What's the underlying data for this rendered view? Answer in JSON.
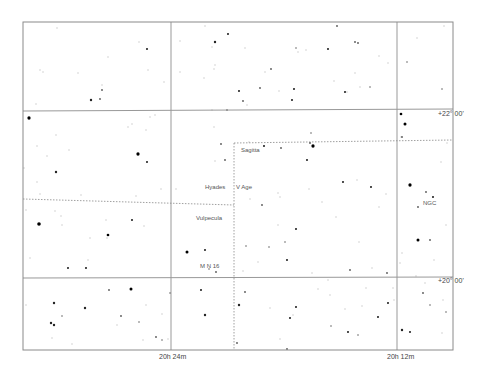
{
  "map": {
    "type": "star-chart",
    "frame": {
      "x": 23,
      "y": 22,
      "width": 430,
      "height": 328
    },
    "grid": {
      "color": "#999999",
      "ra_lines": [
        {
          "x": 171,
          "label": "20h 24m"
        },
        {
          "x": 397,
          "label": "20h 12m"
        }
      ],
      "dec_lines": [
        {
          "y1": 111,
          "y2": 109,
          "label": "+22° 00'"
        },
        {
          "y1": 278,
          "y2": 277,
          "label": "+20° 00'"
        }
      ]
    },
    "axis_labels": {
      "ra_left": "20h 24m",
      "ra_right": "20h 12m",
      "dec_top": "+22° 00'",
      "dec_bottom": "+20° 00'"
    },
    "constellation_boundaries": {
      "color": "#888888",
      "segments": [
        {
          "x1": 23,
          "y1": 199,
          "x2": 234,
          "y2": 205
        },
        {
          "x1": 234,
          "y1": 143,
          "x2": 453,
          "y2": 140
        },
        {
          "x1": 234,
          "y1": 143,
          "x2": 234,
          "y2": 350
        }
      ]
    },
    "object_labels": [
      {
        "text": "Sagitta",
        "x": 241,
        "y": 150
      },
      {
        "text": "Hyades",
        "x": 205,
        "y": 187
      },
      {
        "text": "V Age",
        "x": 236,
        "y": 187
      },
      {
        "text": "Vulpecula",
        "x": 197,
        "y": 218
      },
      {
        "text": "M N 16",
        "x": 200,
        "y": 266
      },
      {
        "text": "NGC",
        "x": 423,
        "y": 203
      }
    ],
    "stars": [
      [
        29,
        118,
        2.2
      ],
      [
        39,
        224,
        2.4
      ],
      [
        56,
        172,
        1.6
      ],
      [
        85,
        308,
        1.6
      ],
      [
        91,
        100,
        1.6
      ],
      [
        100,
        99,
        1.2
      ],
      [
        102,
        90,
        1.2
      ],
      [
        108,
        235,
        1.8
      ],
      [
        86,
        268,
        1.4
      ],
      [
        68,
        268,
        1.4
      ],
      [
        54,
        303,
        1.6
      ],
      [
        51,
        323,
        1.6
      ],
      [
        54,
        325,
        1.6
      ],
      [
        62,
        316,
        1.0
      ],
      [
        147,
        49,
        1.4
      ],
      [
        138,
        154,
        2.2
      ],
      [
        147,
        162,
        1.4
      ],
      [
        131,
        289,
        2.0
      ],
      [
        132,
        220,
        1.4
      ],
      [
        109,
        290,
        1.2
      ],
      [
        121,
        316,
        1.2
      ],
      [
        139,
        322,
        1.0
      ],
      [
        156,
        337,
        1.2
      ],
      [
        162,
        340,
        1.0
      ],
      [
        215,
        42,
        1.6
      ],
      [
        228,
        34,
        1.4
      ],
      [
        227,
        110,
        1.0
      ],
      [
        239,
        91,
        1.4
      ],
      [
        243,
        101,
        1.2
      ],
      [
        260,
        88,
        1.2
      ],
      [
        294,
        89,
        1.4
      ],
      [
        311,
        133,
        1.0
      ],
      [
        292,
        100,
        1.4
      ],
      [
        296,
        48,
        1.0
      ],
      [
        271,
        69,
        1.2
      ],
      [
        328,
        49,
        1.4
      ],
      [
        337,
        26,
        1.2
      ],
      [
        355,
        42,
        1.2
      ],
      [
        358,
        43,
        1.2
      ],
      [
        345,
        92,
        1.4
      ],
      [
        370,
        87,
        1.0
      ],
      [
        401,
        114,
        1.8
      ],
      [
        405,
        124,
        2.0
      ],
      [
        402,
        137,
        1.2
      ],
      [
        187,
        252,
        2.0
      ],
      [
        205,
        250,
        1.4
      ],
      [
        216,
        272,
        1.2
      ],
      [
        201,
        290,
        1.4
      ],
      [
        205,
        315,
        1.6
      ],
      [
        170,
        293,
        1.0
      ],
      [
        209,
        269,
        1.0
      ],
      [
        221,
        144,
        1.2
      ],
      [
        225,
        160,
        1.2
      ],
      [
        264,
        146,
        1.4
      ],
      [
        281,
        148,
        1.2
      ],
      [
        313,
        146,
        2.2
      ],
      [
        310,
        143,
        1.2
      ],
      [
        307,
        160,
        1.4
      ],
      [
        343,
        182,
        1.4
      ],
      [
        371,
        187,
        1.4
      ],
      [
        262,
        205,
        1.2
      ],
      [
        269,
        247,
        1.0
      ],
      [
        296,
        229,
        1.4
      ],
      [
        287,
        260,
        1.4
      ],
      [
        285,
        242,
        1.0
      ],
      [
        246,
        246,
        1.0
      ],
      [
        239,
        305,
        1.6
      ],
      [
        245,
        292,
        1.2
      ],
      [
        237,
        343,
        1.2
      ],
      [
        287,
        349,
        1.2
      ],
      [
        290,
        318,
        1.4
      ],
      [
        296,
        307,
        1.4
      ],
      [
        331,
        326,
        1.0
      ],
      [
        348,
        332,
        1.4
      ],
      [
        358,
        335,
        1.0
      ],
      [
        378,
        317,
        1.4
      ],
      [
        388,
        303,
        1.4
      ],
      [
        410,
        185,
        2.2
      ],
      [
        426,
        192,
        1.2
      ],
      [
        418,
        207,
        1.2
      ],
      [
        433,
        197,
        1.4
      ],
      [
        418,
        240,
        2.0
      ],
      [
        423,
        293,
        1.2
      ],
      [
        430,
        305,
        1.0
      ],
      [
        402,
        330,
        1.6
      ],
      [
        410,
        332,
        1.4
      ],
      [
        446,
        312,
        1.0
      ],
      [
        350,
        270,
        1.2
      ],
      [
        387,
        273,
        1.2
      ],
      [
        407,
        62,
        1.0
      ],
      [
        442,
        89,
        1.0
      ],
      [
        430,
        240,
        1.2
      ]
    ],
    "faint_stars": [
      [
        57,
        28
      ],
      [
        78,
        73
      ],
      [
        40,
        70
      ],
      [
        43,
        72
      ],
      [
        108,
        57
      ],
      [
        102,
        85
      ],
      [
        36,
        104
      ],
      [
        56,
        135
      ],
      [
        37,
        146
      ],
      [
        47,
        156
      ],
      [
        37,
        182
      ],
      [
        69,
        150
      ],
      [
        128,
        127
      ],
      [
        150,
        117
      ],
      [
        146,
        130
      ],
      [
        155,
        115
      ],
      [
        24,
        168
      ],
      [
        40,
        194
      ],
      [
        26,
        210
      ],
      [
        81,
        195
      ],
      [
        55,
        211
      ],
      [
        61,
        216
      ],
      [
        90,
        238
      ],
      [
        106,
        220
      ],
      [
        144,
        226
      ],
      [
        176,
        189
      ],
      [
        161,
        189
      ],
      [
        136,
        196
      ],
      [
        132,
        124
      ],
      [
        164,
        82
      ],
      [
        148,
        70
      ],
      [
        139,
        42
      ],
      [
        30,
        258
      ],
      [
        107,
        238
      ],
      [
        62,
        225
      ],
      [
        26,
        305
      ],
      [
        52,
        338
      ],
      [
        72,
        344
      ],
      [
        88,
        260
      ],
      [
        117,
        325
      ],
      [
        162,
        314
      ],
      [
        143,
        340
      ],
      [
        168,
        339
      ],
      [
        146,
        305
      ],
      [
        205,
        26
      ],
      [
        180,
        41
      ],
      [
        212,
        47
      ],
      [
        180,
        72
      ],
      [
        204,
        78
      ],
      [
        212,
        110
      ],
      [
        214,
        127
      ],
      [
        215,
        65
      ],
      [
        245,
        48
      ],
      [
        279,
        91
      ],
      [
        265,
        72
      ],
      [
        214,
        69
      ],
      [
        247,
        105
      ],
      [
        306,
        50
      ],
      [
        298,
        52
      ],
      [
        334,
        81
      ],
      [
        347,
        92
      ],
      [
        360,
        87
      ],
      [
        379,
        56
      ],
      [
        388,
        63
      ],
      [
        355,
        73
      ],
      [
        401,
        137
      ],
      [
        417,
        38
      ],
      [
        444,
        26
      ],
      [
        249,
        142
      ],
      [
        215,
        161
      ],
      [
        250,
        199
      ],
      [
        243,
        271
      ],
      [
        280,
        197
      ],
      [
        278,
        225
      ],
      [
        258,
        262
      ],
      [
        278,
        193
      ],
      [
        309,
        189
      ],
      [
        322,
        202
      ],
      [
        336,
        217
      ],
      [
        357,
        180
      ],
      [
        379,
        207
      ],
      [
        386,
        194
      ],
      [
        402,
        253
      ],
      [
        400,
        263
      ],
      [
        359,
        242
      ],
      [
        312,
        273
      ],
      [
        293,
        315
      ],
      [
        280,
        339
      ],
      [
        270,
        308
      ],
      [
        318,
        289
      ],
      [
        328,
        280
      ],
      [
        345,
        309
      ],
      [
        362,
        306
      ],
      [
        366,
        288
      ],
      [
        330,
        295
      ],
      [
        434,
        260
      ],
      [
        446,
        225
      ],
      [
        447,
        143
      ],
      [
        441,
        162
      ],
      [
        416,
        276
      ],
      [
        443,
        300
      ],
      [
        425,
        283
      ],
      [
        442,
        333
      ],
      [
        393,
        288
      ],
      [
        394,
        300
      ],
      [
        372,
        268
      ]
    ]
  }
}
